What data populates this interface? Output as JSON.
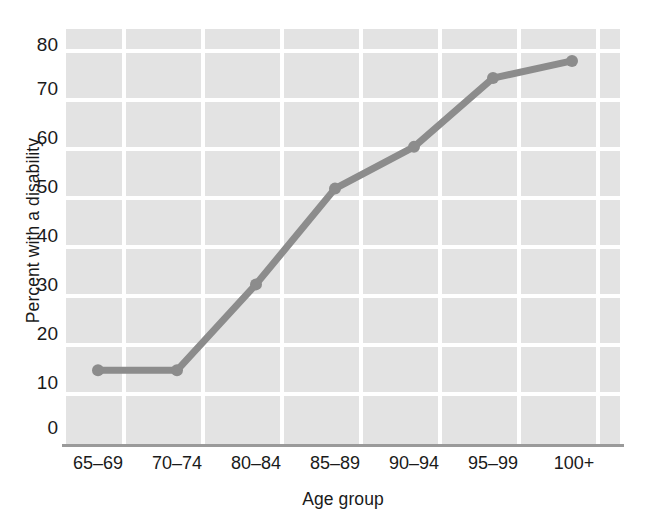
{
  "chart_data": {
    "type": "line",
    "title": "",
    "xlabel": "Age group",
    "ylabel": "Percent with a disability",
    "categories": [
      "65–69",
      "70–74",
      "80–84",
      "85–89",
      "90–94",
      "95–99",
      "100+"
    ],
    "values": [
      15,
      15,
      32.5,
      52,
      60.5,
      74.5,
      78
    ],
    "series": [
      {
        "name": "Percent with a disability",
        "values": [
          15,
          15,
          32.5,
          52,
          60.5,
          74.5,
          78
        ]
      }
    ],
    "ylim": [
      0,
      84.5
    ],
    "xlim": [
      0,
      7
    ],
    "yticks": [
      80,
      70,
      60,
      50,
      40,
      30,
      20,
      10,
      0
    ],
    "ytick_labels": [
      "80",
      "70",
      "60",
      "50",
      "40",
      "30",
      "20",
      "10",
      "0"
    ],
    "grid": true,
    "grid_color": "#ffffff",
    "legend": "none",
    "panel_color": "#e3e3e3",
    "line_color": "#8c8c8c",
    "marker": "circle",
    "marker_color": "#8c8c8c"
  }
}
